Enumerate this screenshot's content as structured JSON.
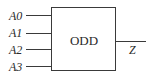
{
  "diagram": {
    "type": "logic-block",
    "block": {
      "label": "ODD"
    },
    "inputs": [
      {
        "label": "A0"
      },
      {
        "label": "A1"
      },
      {
        "label": "A2"
      },
      {
        "label": "A3"
      }
    ],
    "output": {
      "label": "Z"
    },
    "colors": {
      "stroke": "#3a3a3a",
      "text": "#2a2a2a",
      "background": "#ffffff"
    }
  }
}
